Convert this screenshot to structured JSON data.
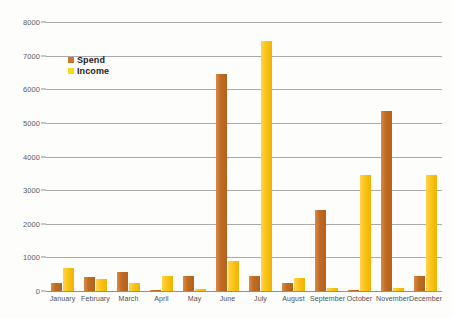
{
  "chart_data": {
    "type": "bar",
    "title": "",
    "subtitle": "",
    "xlabel": "",
    "ylabel": "",
    "ylim": [
      0,
      8000
    ],
    "ytick_values": [
      8000,
      7000,
      6000,
      5000,
      4000,
      3000,
      2000,
      1000,
      0
    ],
    "ytick_labels": [
      "8000",
      "7000",
      "6000",
      "5000",
      "4000",
      "3000",
      "2000",
      "1000",
      "0"
    ],
    "grid": "horizontal",
    "legend_position": "upper-left-inside",
    "categories": [
      "January",
      "February",
      "March",
      "April",
      "May",
      "June",
      "July",
      "August",
      "September",
      "October",
      "November",
      "December"
    ],
    "series": [
      {
        "name": "Spend",
        "color": "#c06b22",
        "values": [
          250,
          430,
          560,
          30,
          450,
          6450,
          450,
          250,
          2400,
          40,
          5350,
          450
        ]
      },
      {
        "name": "Income",
        "color": "#fbc51b",
        "values": [
          680,
          360,
          240,
          450,
          70,
          900,
          7450,
          380,
          80,
          3450,
          100,
          3450
        ]
      }
    ]
  },
  "legend": {
    "items": [
      {
        "label": "Spend",
        "swatch": "spend"
      },
      {
        "label": "Income",
        "swatch": "income"
      }
    ]
  }
}
